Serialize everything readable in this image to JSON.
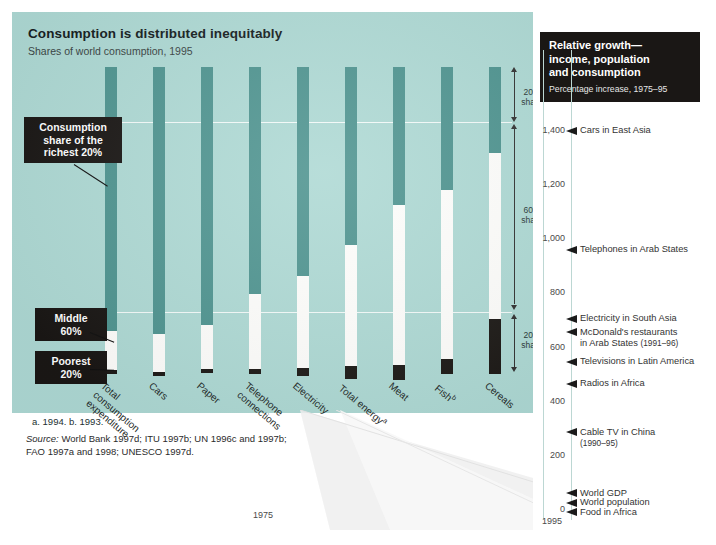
{
  "chart_data": {
    "type": "bar",
    "title": "Consumption is distributed inequitably",
    "subtitle": "Shares of world consumption, 1995",
    "xlabel": "",
    "ylabel": "Share of world consumption (%)",
    "ylim": [
      0,
      100
    ],
    "stacked": true,
    "grid": true,
    "categories": [
      "Total consumption expenditure",
      "Cars",
      "Paper",
      "Telephone connections",
      "Electricity",
      "Total energy",
      "Meat",
      "Fish",
      "Cereals"
    ],
    "series": [
      {
        "name": "Richest 20%",
        "color": "#4f9490",
        "values": [
          86,
          87,
          84,
          74,
          68,
          58,
          45,
          40,
          28
        ]
      },
      {
        "name": "Middle 60%",
        "color": "#fdfdfb",
        "values": [
          12.8,
          12.5,
          14.5,
          24.5,
          30,
          39.5,
          52,
          55,
          54
        ]
      },
      {
        "name": "Poorest 20%",
        "color": "#1d1a17",
        "values": [
          1.3,
          1.1,
          1.1,
          1.5,
          2.5,
          4,
          5,
          5,
          18
        ]
      }
    ],
    "annotations": [
      "Consumption share of the richest 20%",
      "Middle 60%",
      "Poorest 20%",
      "20% share",
      "60% share",
      "20% share"
    ],
    "footnotes": "a. 1994.   b. 1993.",
    "source_lines": [
      "Source: World Bank 1997d; ITU 1997b; UN 1996c and 1997b;",
      "FAO 1997a and 1998; UNESCO 1997d."
    ]
  },
  "left": {
    "title": "Consumption is distributed inequitably",
    "subtitle": "Shares of world consumption, 1995",
    "bars": [
      {
        "label_lines": [
          "Total",
          "consumption",
          "expenditure"
        ],
        "sup": "",
        "rich": 86,
        "mid": 12.8,
        "poor": 1.3
      },
      {
        "label_lines": [
          "Cars"
        ],
        "sup": "",
        "rich": 87,
        "mid": 12.5,
        "poor": 1.1
      },
      {
        "label_lines": [
          "Paper"
        ],
        "sup": "",
        "rich": 84,
        "mid": 14.5,
        "poor": 1.1
      },
      {
        "label_lines": [
          "Telephone",
          "connections"
        ],
        "sup": "",
        "rich": 74,
        "mid": 24.5,
        "poor": 1.5
      },
      {
        "label_lines": [
          "Electricity"
        ],
        "sup": "",
        "rich": 68,
        "mid": 30,
        "poor": 2.5
      },
      {
        "label_lines": [
          "Total energy"
        ],
        "sup": "a",
        "rich": 58,
        "mid": 39.5,
        "poor": 4
      },
      {
        "label_lines": [
          "Meat"
        ],
        "sup": "",
        "rich": 45,
        "mid": 52,
        "poor": 5
      },
      {
        "label_lines": [
          "Fish"
        ],
        "sup": "b",
        "rich": 40,
        "mid": 55,
        "poor": 5
      },
      {
        "label_lines": [
          "Cereals"
        ],
        "sup": "",
        "rich": 28,
        "mid": 54,
        "poor": 18
      }
    ],
    "callouts": {
      "richest": "Consumption share of the richest 20%",
      "richest_l1": "Consumption",
      "richest_l2": "share of the",
      "richest_l3": "richest 20%",
      "middle_l1": "Middle",
      "middle_l2": "60%",
      "poorest_l1": "Poorest",
      "poorest_l2": "20%"
    },
    "share_scale": {
      "top_l1": "20%",
      "top_l2": "share",
      "mid_l1": "60%",
      "mid_l2": "share",
      "bot_l1": "20%",
      "bot_l2": "share"
    },
    "footnotes": "a. 1994.   b. 1993.",
    "source_line1_label": "Source:",
    "source_line1": " World Bank 1997d; ITU 1997b; UN 1996c and 1997b;",
    "source_line2": "FAO 1997a and 1998; UNESCO 1997d."
  },
  "right": {
    "header_title_l1": "Relative growth—",
    "header_title_l2": "income, population",
    "header_title_l3": "and consumption",
    "header_sub": "Percentage increase, 1975–95",
    "axis": {
      "ticks": [
        "1,400",
        "1,200",
        "1,000",
        "800",
        "600",
        "400",
        "200",
        "0"
      ],
      "values": [
        1400,
        1200,
        1000,
        800,
        600,
        400,
        200,
        0
      ],
      "ymin": 0,
      "ymax": 1500
    },
    "year_start": "1975",
    "year_end": "1995",
    "markers": [
      {
        "label": "Cars in East Asia",
        "sub": "",
        "value": 1400
      },
      {
        "label": "Telephones in Arab States",
        "sub": "",
        "value": 960
      },
      {
        "label": "Electricity in South Asia",
        "sub": "",
        "value": 705
      },
      {
        "label": "McDonald's restaurants",
        "sub": "",
        "value": 655,
        "label2": "in Arab States",
        "years": "(1991–96)"
      },
      {
        "label": "Televisions in Latin America",
        "sub": "",
        "value": 545
      },
      {
        "label": "Radios in Africa",
        "sub": "",
        "value": 465
      },
      {
        "label": "Cable TV in China",
        "sub": "(1990–95)",
        "value": 285
      },
      {
        "label": "World GDP",
        "sub": "",
        "value": 60
      },
      {
        "label": "World population",
        "sub": "",
        "value": 25
      },
      {
        "label": "Food in Africa",
        "sub": "",
        "value": -10
      }
    ]
  }
}
